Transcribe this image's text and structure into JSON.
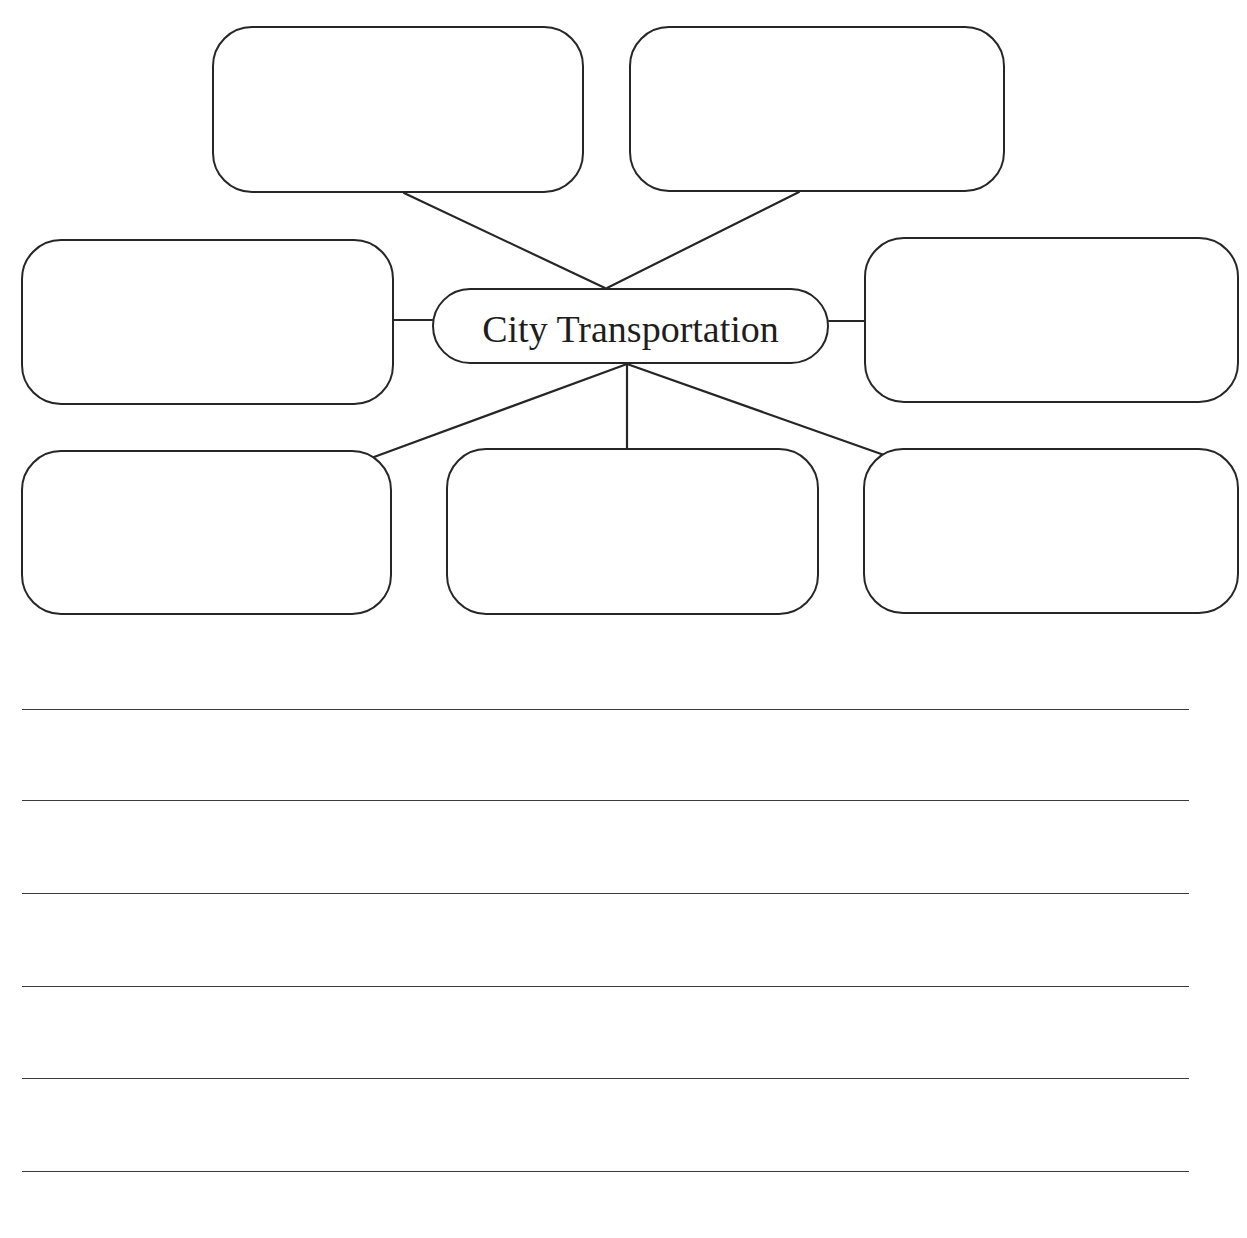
{
  "diagram": {
    "type": "concept-web",
    "center": {
      "label": "City Transportation"
    },
    "nodes": [
      {
        "id": "top-left",
        "label": ""
      },
      {
        "id": "top-right",
        "label": ""
      },
      {
        "id": "middle-left",
        "label": ""
      },
      {
        "id": "middle-right",
        "label": ""
      },
      {
        "id": "bottom-left",
        "label": ""
      },
      {
        "id": "bottom-center",
        "label": ""
      },
      {
        "id": "bottom-right",
        "label": ""
      }
    ]
  },
  "writing_area": {
    "line_count": 6,
    "lines": [
      "",
      "",
      "",
      "",
      "",
      ""
    ]
  },
  "colors": {
    "stroke": "#262626",
    "background": "#ffffff",
    "text": "#1e1e1e"
  }
}
